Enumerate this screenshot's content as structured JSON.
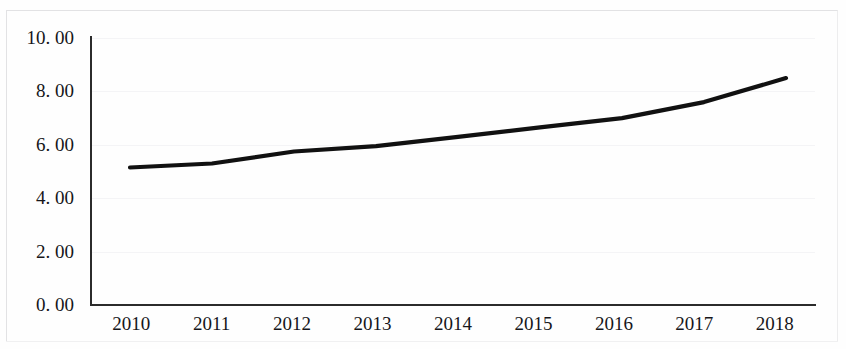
{
  "chart_data": {
    "type": "line",
    "title": "",
    "subtitle": "",
    "xlabel": "",
    "ylabel": "",
    "categories": [
      "2010",
      "2011",
      "2012",
      "2013",
      "2014",
      "2015",
      "2016",
      "2017",
      "2018"
    ],
    "x": [
      2010,
      2011,
      2012,
      2013,
      2014,
      2015,
      2016,
      2017,
      2018
    ],
    "series": [
      {
        "name": "",
        "values": [
          5.15,
          5.3,
          5.75,
          5.95,
          6.3,
          6.65,
          7.0,
          7.6,
          8.5
        ]
      }
    ],
    "ylim": [
      0,
      10
    ],
    "ytick_values": [
      0,
      2,
      4,
      6,
      8,
      10
    ],
    "ytick_labels": [
      "0. 00",
      "2. 00",
      "4. 00",
      "6. 00",
      "8. 00",
      "10. 00"
    ],
    "xtick_labels": [
      "2010",
      "2011",
      "2012",
      "2013",
      "2014",
      "2015",
      "2016",
      "2017",
      "2018"
    ],
    "grid": true,
    "grid_axis": "y",
    "legend": false,
    "legend_position": "none",
    "annotations": [],
    "line_color": "#111111",
    "axis_color": "#2b2b2b",
    "grid_color": "#f4f4f6",
    "background_color": "#fefefe"
  }
}
